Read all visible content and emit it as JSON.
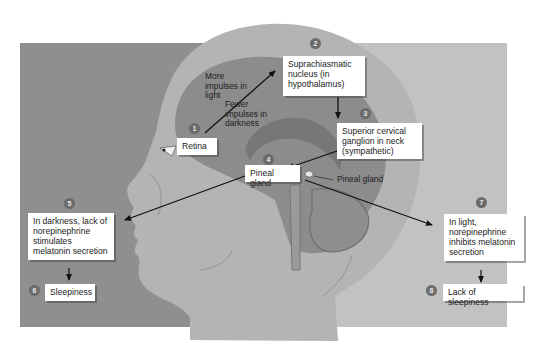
{
  "diagram": {
    "colors": {
      "bg_left": "#8f8f8f",
      "bg_right": "#c2c2c2",
      "head_skin": "#b4b4b4",
      "brain": "#8c8c8c",
      "brain_inner": "#7a7a7a",
      "label_bg": "#ffffff",
      "step_badge": "#6b6b6b",
      "arrow": "#111111"
    },
    "steps": [
      {
        "number": "1",
        "label": "Retina"
      },
      {
        "number": "2",
        "label": "Suprachiasmatic nucleus (in hypothalamus)"
      },
      {
        "number": "3",
        "label": "Superior cervical ganglion in neck (sympathetic)"
      },
      {
        "number": "4",
        "label": "Pineal gland"
      },
      {
        "number": "5",
        "label": "In darkness, lack of norepinephrine stimulates melatonin secretion"
      },
      {
        "number": "6",
        "label": "Sleepiness"
      },
      {
        "number": "7",
        "label": "In light, norepinephrine inhibits melatonin secretion"
      },
      {
        "number": "8",
        "label": "Lack of sleepiness"
      }
    ],
    "annotations": {
      "more_impulses": "More impulses in light",
      "fewer_impulses": "Fewer impulses in darkness",
      "pineal_callout": "Pineal gland"
    }
  }
}
